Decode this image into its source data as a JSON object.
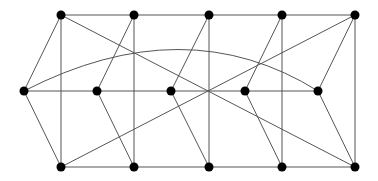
{
  "diagram": {
    "type": "graph",
    "nodes": [
      {
        "id": "T1",
        "x": 61,
        "y": 15
      },
      {
        "id": "T2",
        "x": 134,
        "y": 15
      },
      {
        "id": "T3",
        "x": 209,
        "y": 15
      },
      {
        "id": "T4",
        "x": 282,
        "y": 15
      },
      {
        "id": "T5",
        "x": 355,
        "y": 15
      },
      {
        "id": "M1",
        "x": 24,
        "y": 91
      },
      {
        "id": "M2",
        "x": 97,
        "y": 91
      },
      {
        "id": "M3",
        "x": 171,
        "y": 91
      },
      {
        "id": "M4",
        "x": 245,
        "y": 91
      },
      {
        "id": "M5",
        "x": 318,
        "y": 91
      },
      {
        "id": "B1",
        "x": 61,
        "y": 167
      },
      {
        "id": "B2",
        "x": 134,
        "y": 167
      },
      {
        "id": "B3",
        "x": 209,
        "y": 167
      },
      {
        "id": "B4",
        "x": 282,
        "y": 167
      },
      {
        "id": "B5",
        "x": 355,
        "y": 167
      }
    ],
    "edges": [
      [
        "T1",
        "T2"
      ],
      [
        "T2",
        "T3"
      ],
      [
        "T3",
        "T4"
      ],
      [
        "T4",
        "T5"
      ],
      [
        "M1",
        "M2"
      ],
      [
        "M2",
        "M3"
      ],
      [
        "M3",
        "M4"
      ],
      [
        "M4",
        "M5"
      ],
      [
        "B1",
        "B2"
      ],
      [
        "B2",
        "B3"
      ],
      [
        "B3",
        "B4"
      ],
      [
        "B4",
        "B5"
      ],
      [
        "T1",
        "B1"
      ],
      [
        "T2",
        "B2"
      ],
      [
        "T3",
        "B3"
      ],
      [
        "T4",
        "B4"
      ],
      [
        "T5",
        "B5"
      ],
      [
        "M1",
        "T1"
      ],
      [
        "M1",
        "B1"
      ],
      [
        "T2",
        "M2"
      ],
      [
        "T3",
        "M3"
      ],
      [
        "T4",
        "M4"
      ],
      [
        "T5",
        "M5"
      ],
      [
        "M2",
        "B2"
      ],
      [
        "M3",
        "B3"
      ],
      [
        "M4",
        "B4"
      ],
      [
        "M5",
        "B5"
      ],
      [
        "T1",
        "B5"
      ],
      [
        "B1",
        "T5"
      ]
    ],
    "arcs": [
      {
        "from": "M1",
        "to": "M5",
        "control": {
          "x": 185,
          "y": 8
        }
      }
    ],
    "node_radius": 4.5,
    "colors": {
      "edge": "#555555",
      "node": "#000000",
      "background": "#ffffff"
    }
  }
}
